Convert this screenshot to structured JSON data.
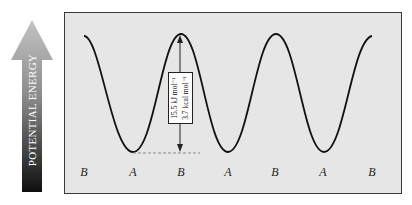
{
  "axis": {
    "y_label": "POTENTIAL ENERGY",
    "arrow_color_top": "#b8b8b8",
    "arrow_color_bottom": "#111111"
  },
  "energy_barrier": {
    "line1": "15.5 kJ mol⁻¹",
    "line2": "3.7 kcal mol⁻¹"
  },
  "conformations": [
    {
      "label": "B",
      "x": 84
    },
    {
      "label": "A",
      "x": 133
    },
    {
      "label": "B",
      "x": 181
    },
    {
      "label": "A",
      "x": 228
    },
    {
      "label": "B",
      "x": 275
    },
    {
      "label": "A",
      "x": 323
    },
    {
      "label": "B",
      "x": 372
    }
  ],
  "colors": {
    "background": "#e6e6e6",
    "curve": "#111111",
    "dashed_line": "#888888"
  }
}
